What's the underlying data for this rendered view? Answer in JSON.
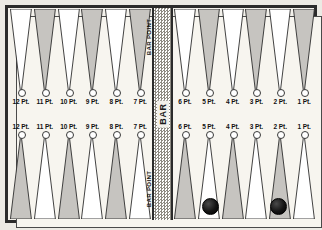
{
  "board": {
    "title": "Backgammon Board Diagram",
    "bar_label": "BAR",
    "bar_point_label_top": "BAR POINT",
    "bar_point_label_bottom": "BAR POINT",
    "colors": {
      "frame": "#2b2b2b",
      "board_background": "#f7f5ef",
      "stipple_fill": "#8d8a82",
      "plain_fill": "#ffffff",
      "checker": "#141414",
      "bar_fill": "#dcd9d1"
    }
  },
  "quadrants": {
    "top_left": {
      "name": "top-left-quadrant",
      "points": [
        {
          "label": "12 Pt.",
          "fill": "plain"
        },
        {
          "label": "11 Pt.",
          "fill": "stipple"
        },
        {
          "label": "10 Pt.",
          "fill": "plain"
        },
        {
          "label": "9 Pt.",
          "fill": "stipple"
        },
        {
          "label": "8 Pt.",
          "fill": "plain"
        },
        {
          "label": "7 Pt.",
          "fill": "stipple"
        }
      ]
    },
    "top_right": {
      "name": "top-right-quadrant",
      "points": [
        {
          "label": "6 Pt.",
          "fill": "plain"
        },
        {
          "label": "5 Pt.",
          "fill": "stipple"
        },
        {
          "label": "4 Pt.",
          "fill": "plain"
        },
        {
          "label": "3 Pt.",
          "fill": "stipple"
        },
        {
          "label": "2 Pt.",
          "fill": "plain"
        },
        {
          "label": "1 Pt.",
          "fill": "stipple"
        }
      ]
    },
    "bottom_left": {
      "name": "bottom-left-quadrant",
      "points": [
        {
          "label": "12 Pt.",
          "fill": "stipple"
        },
        {
          "label": "11 Pt.",
          "fill": "plain"
        },
        {
          "label": "10 Pt.",
          "fill": "stipple"
        },
        {
          "label": "9 Pt.",
          "fill": "plain"
        },
        {
          "label": "8 Pt.",
          "fill": "stipple"
        },
        {
          "label": "7 Pt.",
          "fill": "plain"
        }
      ]
    },
    "bottom_right": {
      "name": "bottom-right-quadrant",
      "points": [
        {
          "label": "6 Pt.",
          "fill": "stipple"
        },
        {
          "label": "5 Pt.",
          "fill": "plain"
        },
        {
          "label": "4 Pt.",
          "fill": "stipple"
        },
        {
          "label": "3 Pt.",
          "fill": "plain"
        },
        {
          "label": "2 Pt.",
          "fill": "stipple"
        },
        {
          "label": "1 Pt.",
          "fill": "plain"
        }
      ]
    }
  },
  "checkers": [
    {
      "name": "checker-bottom-5pt",
      "quadrant": "bottom_right",
      "point": "5 Pt.",
      "color": "dark"
    },
    {
      "name": "checker-bottom-2pt",
      "quadrant": "bottom_right",
      "point": "2 Pt.",
      "color": "dark"
    }
  ]
}
